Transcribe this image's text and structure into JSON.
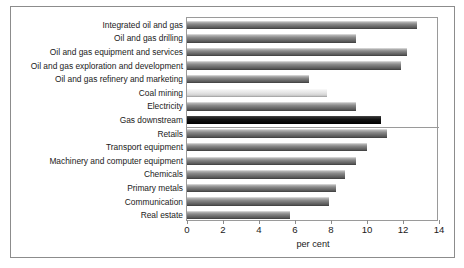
{
  "chart_data": {
    "type": "bar",
    "orientation": "horizontal",
    "title": "",
    "xlabel": "per cent",
    "ylabel": "",
    "xlim": [
      0,
      14
    ],
    "xticks": [
      0,
      2,
      4,
      6,
      8,
      10,
      12,
      14
    ],
    "xtick_labels": [
      "0",
      "2",
      "4",
      "6",
      "8",
      "10",
      "12",
      "14"
    ],
    "grid": false,
    "legend": "none",
    "categories": [
      "Integrated oil and gas",
      "Oil and gas drilling",
      "Oil and gas equipment and services",
      "Oil and gas exploration and development",
      "Oil and gas refinery and marketing",
      "Coal mining",
      "Electricity",
      "Gas downstream",
      "Retails",
      "Transport equipment",
      "Machinery and computer equipment",
      "Chemicals",
      "Primary metals",
      "Communication",
      "Real estate"
    ],
    "values": [
      12.8,
      9.4,
      12.2,
      11.9,
      6.8,
      7.8,
      9.4,
      10.8,
      11.1,
      10.0,
      9.4,
      8.8,
      8.3,
      7.9,
      5.7
    ],
    "bar_styles": [
      "normal",
      "normal",
      "normal",
      "normal",
      "normal",
      "light",
      "normal",
      "dark",
      "normal",
      "normal",
      "normal",
      "normal",
      "normal",
      "normal",
      "normal"
    ],
    "section_divider_after": "Gas downstream",
    "colors": {
      "bar": "#6f6f6f",
      "bar_light": "#e3e3e3",
      "bar_dark": "#000000",
      "frame": "#9a9a9a",
      "text": "#1a1a1a"
    }
  }
}
